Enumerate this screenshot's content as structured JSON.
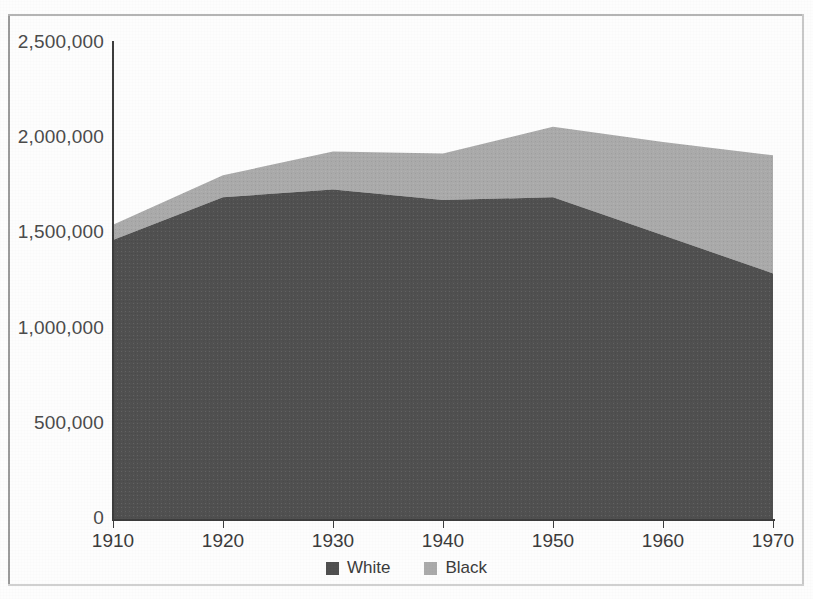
{
  "chart_data": {
    "type": "area",
    "stacked": true,
    "title": "",
    "subtitle": "",
    "xlabel": "",
    "ylabel": "",
    "x": [
      1910,
      1920,
      1930,
      1940,
      1950,
      1960,
      1970
    ],
    "xtick_labels": [
      "1910",
      "1920",
      "1930",
      "1940",
      "1950",
      "1960",
      "1970"
    ],
    "ytick_labels": [
      "0",
      "500,000",
      "1,000,000",
      "1,500,000",
      "2,000,000",
      "2,500,000"
    ],
    "ytick_values": [
      0,
      500000,
      1000000,
      1500000,
      2000000,
      2500000
    ],
    "xlim": [
      1910,
      1970
    ],
    "ylim": [
      0,
      2500000
    ],
    "grid": false,
    "legend_position": "bottom-center",
    "series": [
      {
        "name": "White",
        "color": "#4f4f4f",
        "values": [
          1465000,
          1690000,
          1730000,
          1675000,
          1690000,
          1490000,
          1290000
        ]
      },
      {
        "name": "Black",
        "color": "#aaaaaa",
        "values": [
          80000,
          115000,
          200000,
          245000,
          370000,
          490000,
          620000
        ]
      }
    ],
    "cumulative_totals": [
      1545000,
      1805000,
      1930000,
      1920000,
      2060000,
      1980000,
      1910000
    ]
  },
  "legend": {
    "items": [
      {
        "label": "White",
        "color": "#4f4f4f"
      },
      {
        "label": "Black",
        "color": "#aaaaaa"
      }
    ]
  },
  "axes": {
    "y_ticks": [
      {
        "label": "2,500,000",
        "value": 2500000
      },
      {
        "label": "2,000,000",
        "value": 2000000
      },
      {
        "label": "1,500,000",
        "value": 1500000
      },
      {
        "label": "1,000,000",
        "value": 1000000
      },
      {
        "label": "500,000",
        "value": 500000
      },
      {
        "label": "0",
        "value": 0
      }
    ],
    "x_ticks": [
      {
        "label": "1910",
        "value": 1910
      },
      {
        "label": "1920",
        "value": 1920
      },
      {
        "label": "1930",
        "value": 1930
      },
      {
        "label": "1940",
        "value": 1940
      },
      {
        "label": "1950",
        "value": 1950
      },
      {
        "label": "1960",
        "value": 1960
      },
      {
        "label": "1970",
        "value": 1970
      }
    ]
  }
}
